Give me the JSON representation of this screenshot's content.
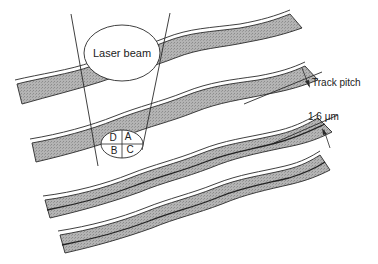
{
  "figure": {
    "labels": {
      "laser_beam": "Laser beam",
      "track_pitch": "Track pitch",
      "pitch_value": "1.6 μm"
    },
    "detector_segments": [
      "D",
      "A",
      "B",
      "C"
    ],
    "colors": {
      "track_fill": "#a8a8a8",
      "line": "#2a2a2a",
      "background": "#ffffff"
    },
    "track_count": 4
  }
}
